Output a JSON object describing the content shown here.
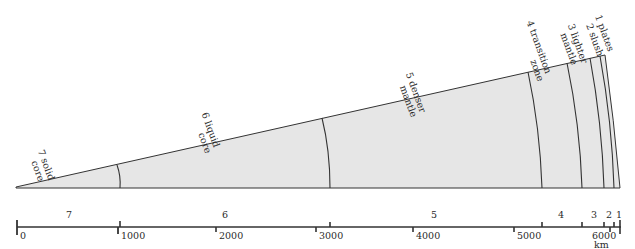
{
  "figure": {
    "type": "earth-cross-section-wedge",
    "fill_color": "#e6e6e6",
    "line_color": "#333333",
    "unit_label": "km"
  },
  "layers": [
    {
      "number": "1",
      "name": "plates",
      "label_lines": [
        "1 plates"
      ],
      "outer_km": 6371,
      "inner_km": 6330
    },
    {
      "number": "2",
      "name": "slush",
      "label_lines": [
        "2 slush"
      ],
      "outer_km": 6330,
      "inner_km": 6270
    },
    {
      "number": "3",
      "name": "lighter mantle",
      "label_lines": [
        "3 lighter",
        "mantle"
      ],
      "outer_km": 6270,
      "inner_km": 5980
    },
    {
      "number": "4",
      "name": "transition zone",
      "label_lines": [
        "4 transition",
        "zone"
      ],
      "outer_km": 5980,
      "inner_km": 5250
    },
    {
      "number": "5",
      "name": "denser mantle",
      "label_lines": [
        "5 denser",
        "mantle"
      ],
      "outer_km": 5250,
      "inner_km": 3150
    },
    {
      "number": "6",
      "name": "liquid core",
      "label_lines": [
        "6 liquid",
        "core"
      ],
      "outer_km": 3150,
      "inner_km": 1030
    },
    {
      "number": "7",
      "name": "solid core",
      "label_lines": [
        "7 solid",
        "core"
      ],
      "outer_km": 1030,
      "inner_km": 0
    }
  ],
  "scale": {
    "ticks": [
      "0",
      "1000",
      "2000",
      "3000",
      "4000",
      "5000",
      "6000"
    ],
    "unit": "km",
    "zone_numbers": [
      "7",
      "6",
      "5",
      "4",
      "3",
      "2",
      "1"
    ]
  }
}
